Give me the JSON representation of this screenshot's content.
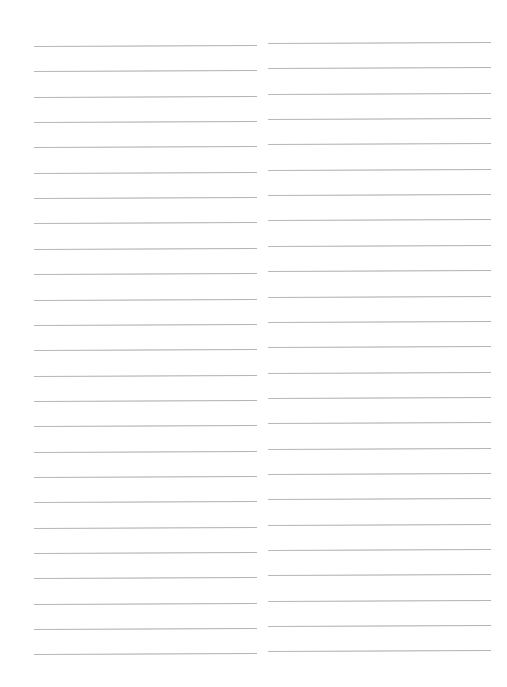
{
  "page": {
    "type": "ruled-paper",
    "background_color": "#ffffff",
    "line_color": "#aaaaaa",
    "columns": [
      {
        "name": "left",
        "x_start": 34,
        "x_end": 257,
        "first_line_y": 46,
        "line_count": 25,
        "line_spacing": 25.35,
        "tilt_deg": -0.25
      },
      {
        "name": "right",
        "x_start": 268,
        "x_end": 491,
        "first_line_y": 43,
        "line_count": 25,
        "line_spacing": 25.35,
        "tilt_deg": -0.25
      }
    ]
  }
}
